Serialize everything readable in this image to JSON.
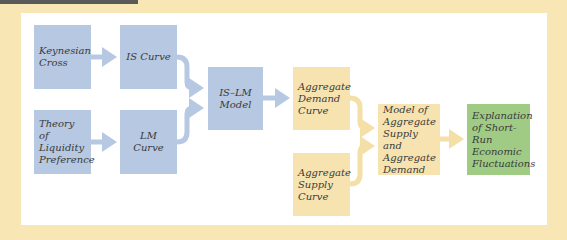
{
  "colors": {
    "frame": "#f8e6b4",
    "panel": "#ffffff",
    "blue_box": "#b6c8e2",
    "tan_box": "#f7e3b0",
    "green_box": "#9fcb85",
    "blue_arrow": "#b6c8e2",
    "tan_arrow": "#f4dfa6",
    "tab": "#5a5a5a"
  },
  "nodes": {
    "keynesian_cross": "Keynesian Cross",
    "is_curve": "IS Curve",
    "liquidity_preference": "Theory of Liquidity Preference",
    "lm_curve": "LM Curve",
    "is_lm_model": "IS–LM Model",
    "aggregate_demand": "Aggregate Demand Curve",
    "aggregate_supply": "Aggregate Supply Curve",
    "ad_as_model": "Model of Aggregate Supply and Aggregate Demand",
    "explanation": "Explanation of Short-Run Economic Fluctuations"
  },
  "edges": [
    {
      "from": "keynesian_cross",
      "to": "is_curve"
    },
    {
      "from": "liquidity_preference",
      "to": "lm_curve"
    },
    {
      "from": "is_curve",
      "to": "is_lm_model"
    },
    {
      "from": "lm_curve",
      "to": "is_lm_model"
    },
    {
      "from": "is_lm_model",
      "to": "aggregate_demand"
    },
    {
      "from": "aggregate_demand",
      "to": "ad_as_model"
    },
    {
      "from": "aggregate_supply",
      "to": "ad_as_model"
    },
    {
      "from": "ad_as_model",
      "to": "explanation"
    }
  ]
}
